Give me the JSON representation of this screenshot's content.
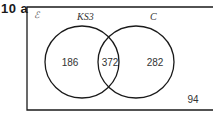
{
  "question": {
    "number": "10",
    "part": "a",
    "label": "10 a"
  },
  "venn": {
    "universal_symbol": "ℰ",
    "sets": [
      {
        "name": "KS3",
        "label": "KS3"
      },
      {
        "name": "C",
        "label": "C"
      }
    ],
    "regions": {
      "ks3_only": "186",
      "intersection": "372",
      "c_only": "282",
      "neither": "94"
    },
    "colors": {
      "stroke": "#1a1a1a",
      "text": "#333333",
      "background": "#ffffff"
    }
  }
}
